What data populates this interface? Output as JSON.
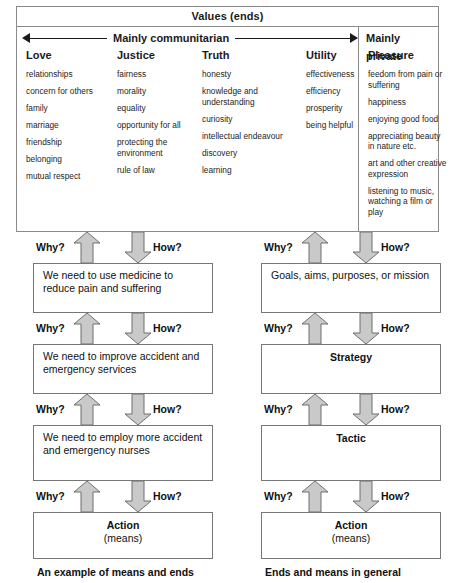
{
  "values_table": {
    "title": "Values (ends)",
    "spectrum": {
      "arrow_label": "Mainly communitarian",
      "private_label": "Mainly private"
    },
    "columns": [
      {
        "heading": "Love",
        "items": [
          "relationships",
          "concern for others",
          "family",
          "marriage",
          "friendship",
          "belonging",
          "mutual respect"
        ]
      },
      {
        "heading": "Justice",
        "items": [
          "fairness",
          "morality",
          "equality",
          "opportunity for all",
          "protecting the environment",
          "rule of law"
        ]
      },
      {
        "heading": "Truth",
        "items": [
          "honesty",
          "knowledge and understanding",
          "curiosity",
          "intellectual endeavour",
          "discovery",
          "learning"
        ]
      },
      {
        "heading": "Utility",
        "items": [
          "effectiveness",
          "efficiency",
          "prosperity",
          "being helpful"
        ]
      },
      {
        "heading": "Pleasure",
        "items": [
          "feedom from pain or suffering",
          "happiness",
          "enjoying good food",
          "appreciating beauty in nature etc.",
          "art and other creative expression",
          "listening to music, watching a film or play"
        ]
      }
    ]
  },
  "diagram": {
    "arrow_labels": {
      "up": "Why?",
      "down": "How?"
    },
    "left_chain": {
      "caption": "An example of means and ends",
      "nodes": [
        {
          "text": "We need to use medicine to reduce pain and suffering",
          "style": "left"
        },
        {
          "text": "We need to improve accident and emergency services",
          "style": "left"
        },
        {
          "text": "We need to employ more accident and emergency nurses",
          "style": "left"
        },
        {
          "text": "Action",
          "sub": "(means)",
          "style": "center"
        }
      ]
    },
    "right_chain": {
      "caption": "Ends and means in general",
      "nodes": [
        {
          "text": "Goals, aims, purposes, or mission",
          "style": "left"
        },
        {
          "text": "Strategy",
          "style": "center"
        },
        {
          "text": "Tactic",
          "style": "center"
        },
        {
          "text": "Action",
          "sub": "(means)",
          "style": "center"
        }
      ]
    }
  },
  "colors": {
    "arrow_fill": "#c9c9c9",
    "arrow_stroke": "#6e6e6e",
    "box_border": "#777777",
    "table_border": "#8a8a8a"
  }
}
